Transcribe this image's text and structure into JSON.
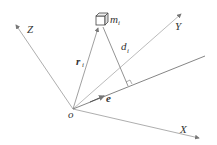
{
  "diagram": {
    "labels": {
      "origin": "o",
      "x_axis": "X",
      "y_axis": "Y",
      "z_axis": "Z",
      "mass": "m",
      "mass_sub": "i",
      "position_vector": "r",
      "position_sub": "i",
      "distance": "d",
      "distance_sub": "i",
      "unit_vector": "e"
    },
    "colors": {
      "lines": "#888888",
      "text": "#333333"
    }
  }
}
